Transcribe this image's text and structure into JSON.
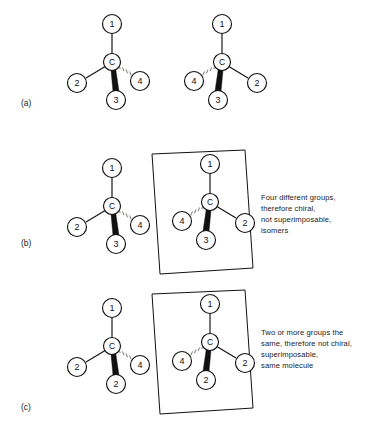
{
  "figure": {
    "background_color": "#ffffff",
    "line_color": "#111111",
    "hash_color": "#6a6a6a"
  },
  "panels": [
    {
      "id": "a",
      "label": "(a)",
      "caption": "",
      "has_mirror_plane": false,
      "molecules": [
        {
          "name": "molecule-a-left",
          "center_label": "C",
          "substituents": [
            {
              "position": "top",
              "label": "1",
              "bond": "plain"
            },
            {
              "position": "left",
              "label": "2",
              "bond": "plain"
            },
            {
              "position": "bottom",
              "label": "3",
              "bond": "wedge"
            },
            {
              "position": "right",
              "label": "4",
              "bond": "hash"
            }
          ]
        },
        {
          "name": "molecule-a-right",
          "center_label": "C",
          "substituents": [
            {
              "position": "top",
              "label": "1",
              "bond": "plain"
            },
            {
              "position": "left",
              "label": "4",
              "bond": "hash"
            },
            {
              "position": "bottom",
              "label": "3",
              "bond": "wedge"
            },
            {
              "position": "right",
              "label": "2",
              "bond": "plain"
            }
          ]
        }
      ]
    },
    {
      "id": "b",
      "label": "(b)",
      "caption": "Four different groups,\ntherefore chiral,\nnot superimposable,\nisomers",
      "has_mirror_plane": true,
      "molecules": [
        {
          "name": "molecule-b-left",
          "center_label": "C",
          "substituents": [
            {
              "position": "top",
              "label": "1",
              "bond": "plain"
            },
            {
              "position": "left",
              "label": "2",
              "bond": "plain"
            },
            {
              "position": "bottom",
              "label": "3",
              "bond": "wedge"
            },
            {
              "position": "right",
              "label": "4",
              "bond": "hash"
            }
          ]
        },
        {
          "name": "molecule-b-right",
          "center_label": "C",
          "substituents": [
            {
              "position": "top",
              "label": "1",
              "bond": "plain"
            },
            {
              "position": "left",
              "label": "4",
              "bond": "hash"
            },
            {
              "position": "bottom",
              "label": "3",
              "bond": "wedge"
            },
            {
              "position": "right",
              "label": "2",
              "bond": "plain"
            }
          ]
        }
      ]
    },
    {
      "id": "c",
      "label": "(c)",
      "caption": "Two or more groups the\nsame, therefore not chiral,\nsuperimposable,\nsame molecule",
      "has_mirror_plane": true,
      "molecules": [
        {
          "name": "molecule-c-left",
          "center_label": "C",
          "substituents": [
            {
              "position": "top",
              "label": "1",
              "bond": "plain"
            },
            {
              "position": "left",
              "label": "2",
              "bond": "plain"
            },
            {
              "position": "bottom",
              "label": "2",
              "bond": "wedge"
            },
            {
              "position": "right",
              "label": "4",
              "bond": "hash"
            }
          ]
        },
        {
          "name": "molecule-c-right",
          "center_label": "C",
          "substituents": [
            {
              "position": "top",
              "label": "1",
              "bond": "plain"
            },
            {
              "position": "left",
              "label": "4",
              "bond": "hash"
            },
            {
              "position": "bottom",
              "label": "2",
              "bond": "wedge"
            },
            {
              "position": "right",
              "label": "2",
              "bond": "plain"
            }
          ]
        }
      ]
    }
  ]
}
